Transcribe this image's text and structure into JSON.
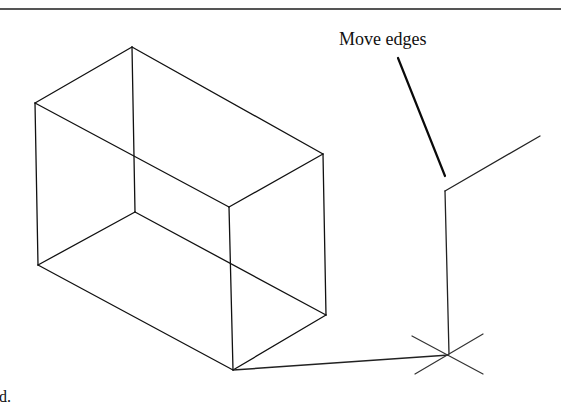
{
  "figure": {
    "callout_label": "Move edges",
    "caption_fragment": "d.",
    "colors": {
      "rule": "#555555",
      "line": "#111111",
      "background": "#ffffff"
    },
    "box": {
      "vertices": {
        "top_back": [
          132,
          47
        ],
        "left_top": [
          35,
          103
        ],
        "right_top": [
          323,
          154
        ],
        "front_top": [
          229,
          207
        ],
        "back_bottom": [
          135,
          212
        ],
        "left_bottom": [
          38,
          265
        ],
        "right_bottom": [
          326,
          315
        ],
        "front_bottom": [
          233,
          370
        ]
      }
    },
    "moved_edges": {
      "corner": [
        445,
        191
      ],
      "upper_end": [
        540,
        136
      ],
      "lower_end": [
        449,
        354
      ]
    },
    "connector": {
      "from": [
        233,
        370
      ],
      "to": [
        449,
        355
      ]
    },
    "leader": {
      "from": [
        398,
        58
      ],
      "to": [
        445,
        176
      ]
    },
    "point_marker": {
      "center": [
        449,
        354
      ]
    }
  }
}
